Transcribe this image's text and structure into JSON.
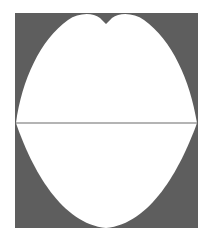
{
  "figure": {
    "colors": {
      "background": "#ffffff",
      "fill": "#5e5e5e",
      "shape": "#ffffff",
      "line": "#6a6a6a"
    }
  }
}
